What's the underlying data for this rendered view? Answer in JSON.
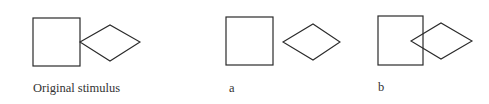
{
  "figure": {
    "panels": [
      {
        "id": "original",
        "label": "Original stimulus",
        "square": {
          "x": 33,
          "y": 18,
          "w": 47,
          "h": 48
        },
        "diamond": {
          "points": "80,42 110,25 140,42 110,61"
        }
      },
      {
        "id": "a",
        "label": "a",
        "square": {
          "x": 226,
          "y": 17,
          "w": 47,
          "h": 48
        },
        "diamond": {
          "points": "283,42 313,24 340,42 313,60"
        }
      },
      {
        "id": "b",
        "label": "b",
        "square": {
          "x": 378,
          "y": 16,
          "w": 45,
          "h": 49
        },
        "diamond": {
          "points": "411,41 441,23 472,41 441,59"
        }
      }
    ],
    "stroke_color": "#2a2a2a"
  }
}
